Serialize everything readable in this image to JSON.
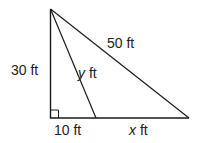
{
  "diagram": {
    "type": "right-triangle-with-cevian",
    "labels": {
      "vertical_side": "30 ft",
      "hypotenuse": "50 ft",
      "cevian_var": "y",
      "cevian_unit": " ft",
      "base_left": "10 ft",
      "base_right_var": "x",
      "base_right_unit": " ft"
    },
    "right_angle_marker": true,
    "colors": {
      "stroke": "#1a1a1a",
      "text": "#222222",
      "background": "#ffffff"
    }
  }
}
